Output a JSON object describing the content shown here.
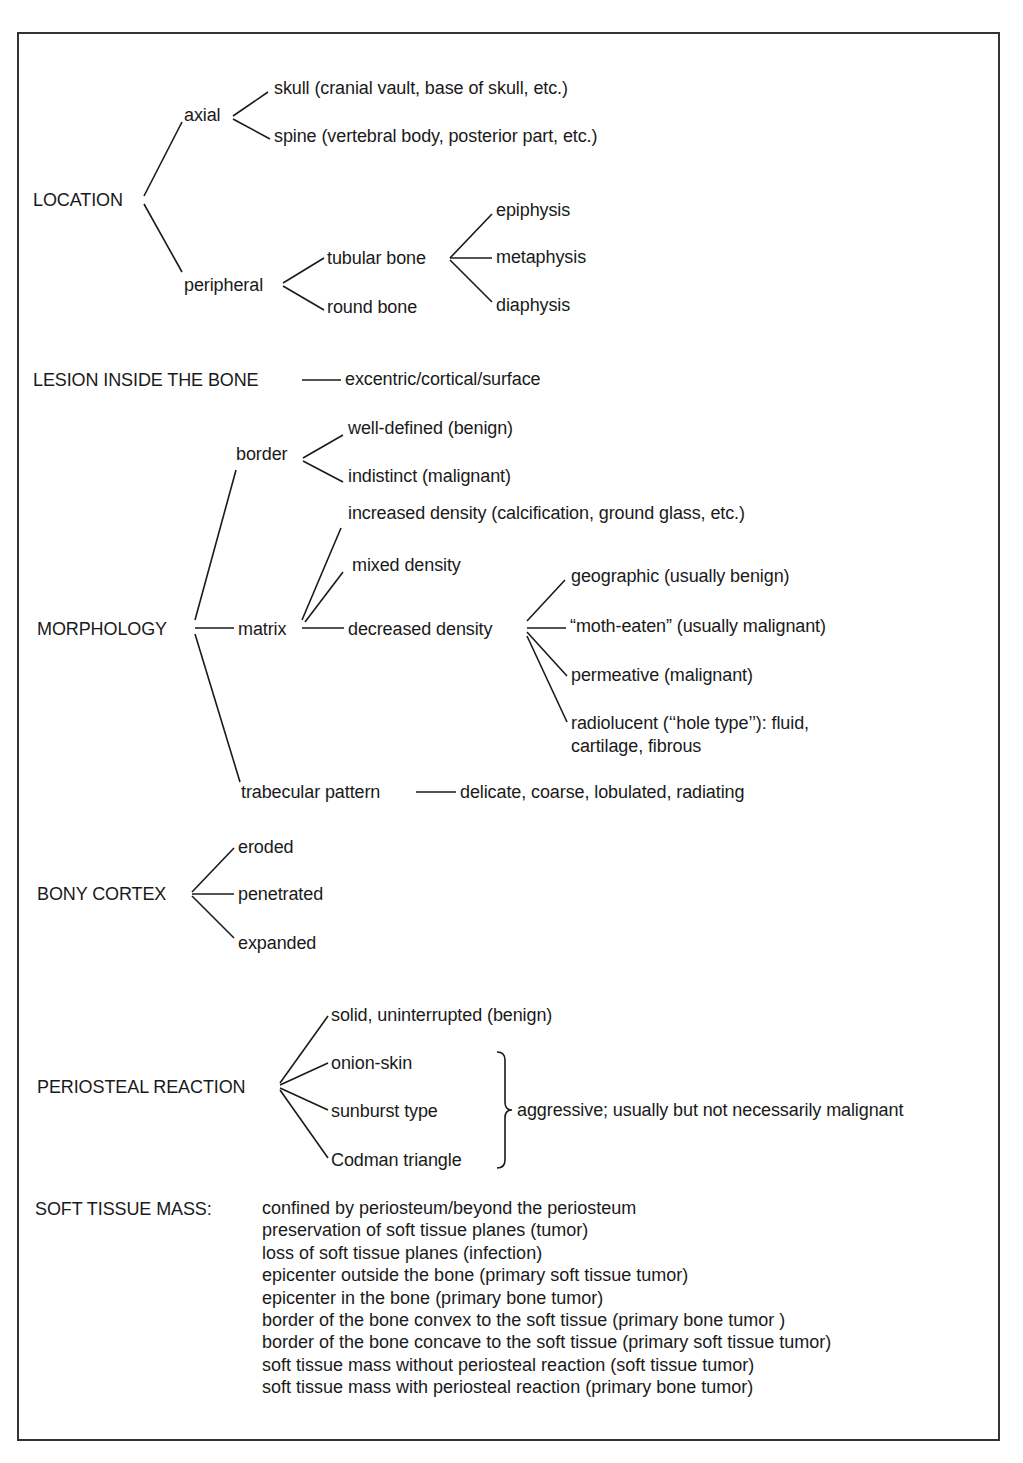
{
  "location": {
    "label": "LOCATION",
    "axial": {
      "label": "axial",
      "children": [
        "skull (cranial vault, base of skull, etc.)",
        "spine (vertebral body, posterior part, etc.)"
      ]
    },
    "peripheral": {
      "label": "peripheral",
      "tubular_bone": {
        "label": "tubular bone",
        "children": [
          "epiphysis",
          "metaphysis",
          "diaphysis"
        ]
      },
      "round_bone": "round bone"
    }
  },
  "lesion": {
    "label": "LESION INSIDE THE BONE",
    "value": "excentric/cortical/surface"
  },
  "morphology": {
    "label": "MORPHOLOGY",
    "border": {
      "label": "border",
      "children": [
        "well-defined (benign)",
        "indistinct (malignant)"
      ]
    },
    "matrix": {
      "label": "matrix",
      "increased": "increased density (calcification, ground glass, etc.)",
      "mixed": "mixed density",
      "decreased": {
        "label": "decreased density",
        "children": [
          "geographic (usually benign)",
          "“moth-eaten” (usually malignant)",
          "permeative (malignant)",
          "radiolucent (‘‘hole type’’): fluid,",
          "cartilage, fibrous"
        ]
      }
    },
    "trabecular": {
      "label": "trabecular pattern",
      "value": "delicate, coarse, lobulated, radiating"
    }
  },
  "bony_cortex": {
    "label": "BONY CORTEX",
    "children": [
      "eroded",
      "penetrated",
      "expanded"
    ]
  },
  "periosteal": {
    "label": "PERIOSTEAL REACTION",
    "children": [
      "solid, uninterrupted (benign)",
      "onion-skin",
      "sunburst type",
      "Codman triangle"
    ],
    "bracket_note": "aggressive; usually but not necessarily malignant"
  },
  "soft_tissue": {
    "label": "SOFT TISSUE MASS:",
    "items": [
      "confined by periosteum/beyond the periosteum",
      "preservation of soft tissue planes (tumor)",
      "loss of soft tissue planes (infection)",
      "epicenter outside the bone (primary soft tissue tumor)",
      "epicenter in the bone (primary bone tumor)",
      "border of the bone convex to the soft tissue (primary bone tumor )",
      "border of the bone concave to the soft tissue (primary soft tissue tumor)",
      "soft tissue mass without periosteal reaction (soft tissue tumor)",
      "soft tissue mass with periosteal reaction (primary bone tumor)"
    ]
  }
}
